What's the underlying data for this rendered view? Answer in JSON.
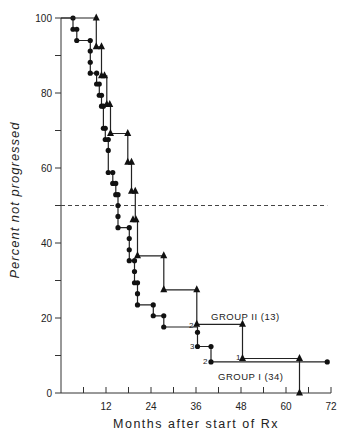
{
  "chart_data": {
    "type": "line",
    "subtype": "kaplan-meier step curve",
    "title": "",
    "xlabel": "Months after start of Rx",
    "ylabel": "Percent not progressed",
    "xlim": [
      0,
      72
    ],
    "ylim": [
      0,
      100
    ],
    "x_ticks": [
      0,
      6,
      12,
      18,
      24,
      30,
      36,
      42,
      48,
      54,
      60,
      66,
      72
    ],
    "x_tick_labels": [
      {
        "value": 12,
        "label": "12"
      },
      {
        "value": 24,
        "label": "24"
      },
      {
        "value": 36,
        "label": "36"
      },
      {
        "value": 48,
        "label": "48"
      },
      {
        "value": 60,
        "label": "60"
      },
      {
        "value": 72,
        "label": "72"
      }
    ],
    "y_ticks": [
      0,
      10,
      20,
      30,
      40,
      50,
      60,
      70,
      80,
      90,
      100
    ],
    "y_tick_labels": [
      {
        "value": 0,
        "label": "0"
      },
      {
        "value": 20,
        "label": "20"
      },
      {
        "value": 40,
        "label": "40"
      },
      {
        "value": 60,
        "label": "60"
      },
      {
        "value": 80,
        "label": "80"
      },
      {
        "value": 100,
        "label": "100"
      }
    ],
    "grid": false,
    "reference_line": {
      "y": 50,
      "style": "dashed",
      "x_start": 0,
      "x_end": 71
    },
    "series": [
      {
        "name": "GROUP I (34)",
        "marker": "circle",
        "steps": [
          [
            0,
            100
          ],
          [
            3.2,
            100
          ],
          [
            3.2,
            97
          ],
          [
            4.2,
            97
          ],
          [
            4.2,
            94
          ],
          [
            7.8,
            94
          ],
          [
            7.8,
            91.2
          ],
          [
            7.8,
            88.2
          ],
          [
            7.8,
            85.3
          ],
          [
            9.5,
            85.3
          ],
          [
            9.5,
            82.4
          ],
          [
            10.2,
            82.4
          ],
          [
            10.2,
            79.4
          ],
          [
            10.8,
            79.4
          ],
          [
            10.8,
            76.5
          ],
          [
            11.3,
            76.5
          ],
          [
            11.3,
            70.6
          ],
          [
            11.8,
            70.6
          ],
          [
            11.8,
            67.6
          ],
          [
            12.6,
            67.6
          ],
          [
            12.6,
            64.7
          ],
          [
            12.6,
            58.8
          ],
          [
            13.8,
            58.8
          ],
          [
            13.8,
            55.9
          ],
          [
            14.6,
            55.9
          ],
          [
            14.6,
            52.9
          ],
          [
            15.2,
            52.9
          ],
          [
            15.2,
            50
          ],
          [
            15.2,
            47.1
          ],
          [
            15.2,
            44.1
          ],
          [
            18.2,
            44.1
          ],
          [
            18.2,
            41.2
          ],
          [
            18.2,
            38.2
          ],
          [
            18.2,
            35.3
          ],
          [
            19.6,
            35.3
          ],
          [
            19.6,
            32.4
          ],
          [
            19.6,
            29.4
          ],
          [
            20.4,
            29.4
          ],
          [
            20.4,
            26.5
          ],
          [
            20.4,
            23.5
          ],
          [
            24.6,
            23.5
          ],
          [
            24.6,
            20.6
          ],
          [
            27.4,
            20.6
          ],
          [
            27.4,
            17.6
          ],
          [
            36.4,
            17.6
          ],
          [
            36.4,
            16.2
          ],
          [
            36.4,
            12.4
          ],
          [
            40,
            12.4
          ],
          [
            40,
            8.3
          ],
          [
            71,
            8.3
          ]
        ],
        "markers": [
          [
            3.2,
            100
          ],
          [
            3.2,
            97
          ],
          [
            4.2,
            97
          ],
          [
            4.2,
            94
          ],
          [
            7.8,
            94
          ],
          [
            7.8,
            91.2
          ],
          [
            7.8,
            88.2
          ],
          [
            7.8,
            85.3
          ],
          [
            9.5,
            85.3
          ],
          [
            9.5,
            82.4
          ],
          [
            10.2,
            82.4
          ],
          [
            10.2,
            79.4
          ],
          [
            10.8,
            79.4
          ],
          [
            10.8,
            76.5
          ],
          [
            11.3,
            76.5
          ],
          [
            11.3,
            70.6
          ],
          [
            11.8,
            70.6
          ],
          [
            11.8,
            67.6
          ],
          [
            12.6,
            67.6
          ],
          [
            12.6,
            64.7
          ],
          [
            12.6,
            58.8
          ],
          [
            13.8,
            58.8
          ],
          [
            13.8,
            55.9
          ],
          [
            14.6,
            55.9
          ],
          [
            14.6,
            52.9
          ],
          [
            15.2,
            52.9
          ],
          [
            15.2,
            50
          ],
          [
            15.2,
            47.1
          ],
          [
            15.2,
            44.1
          ],
          [
            18.2,
            44.1
          ],
          [
            18.2,
            41.2
          ],
          [
            18.2,
            38.2
          ],
          [
            18.2,
            35.3
          ],
          [
            19.6,
            35.3
          ],
          [
            19.6,
            32.4
          ],
          [
            19.6,
            29.4
          ],
          [
            20.4,
            29.4
          ],
          [
            20.4,
            26.5
          ],
          [
            20.4,
            23.5
          ],
          [
            24.6,
            23.5
          ],
          [
            24.6,
            20.6
          ],
          [
            27.4,
            20.6
          ],
          [
            27.4,
            17.6
          ],
          [
            36.4,
            16.2
          ],
          [
            36.4,
            12.4
          ],
          [
            40,
            12.4
          ],
          [
            40,
            8.3
          ],
          [
            71,
            8.3
          ]
        ]
      },
      {
        "name": "GROUP II (13)",
        "marker": "triangle",
        "steps": [
          [
            0,
            100
          ],
          [
            9.4,
            100
          ],
          [
            9.4,
            92.3
          ],
          [
            10.8,
            92.3
          ],
          [
            10.8,
            84.6
          ],
          [
            12.2,
            84.6
          ],
          [
            12.2,
            76.9
          ],
          [
            13.2,
            76.9
          ],
          [
            13.2,
            69.2
          ],
          [
            17.8,
            69.2
          ],
          [
            17.8,
            61.5
          ],
          [
            18.8,
            61.5
          ],
          [
            18.8,
            53.8
          ],
          [
            19.8,
            53.8
          ],
          [
            19.8,
            46.2
          ],
          [
            20.4,
            46.2
          ],
          [
            20.4,
            36.6
          ],
          [
            27.4,
            36.6
          ],
          [
            27.4,
            27.5
          ],
          [
            36.2,
            27.5
          ],
          [
            36.2,
            18.3
          ],
          [
            48.4,
            18.3
          ],
          [
            48.4,
            9.2
          ],
          [
            63.6,
            9.2
          ],
          [
            63.6,
            0
          ]
        ],
        "markers": [
          [
            9.4,
            100
          ],
          [
            9.4,
            92.3
          ],
          [
            10.8,
            92.3
          ],
          [
            10.8,
            84.6
          ],
          [
            11.6,
            84.6
          ],
          [
            12.2,
            76.9
          ],
          [
            13.0,
            76.9
          ],
          [
            13.2,
            69.2
          ],
          [
            17.8,
            69.2
          ],
          [
            17.8,
            61.5
          ],
          [
            18.8,
            61.5
          ],
          [
            18.8,
            53.8
          ],
          [
            19.8,
            53.8
          ],
          [
            19.2,
            46.2
          ],
          [
            20.0,
            46.2
          ],
          [
            20.4,
            36.6
          ],
          [
            27.4,
            36.6
          ],
          [
            27.4,
            27.5
          ],
          [
            36.2,
            27.5
          ],
          [
            36.2,
            18.3
          ],
          [
            48.4,
            18.3
          ],
          [
            48.4,
            9.2
          ],
          [
            63.6,
            9.2
          ],
          [
            63.6,
            0
          ]
        ]
      }
    ],
    "annotations": [
      {
        "text": "GROUP II (13)",
        "x": 40,
        "y": 21
      },
      {
        "text": "GROUP I (34)",
        "x": 42.5,
        "y": 4.5
      },
      {
        "text": "2",
        "x": 34.6,
        "y": 18.3
      },
      {
        "text": "3",
        "x": 35,
        "y": 12.4
      },
      {
        "text": "2",
        "x": 38.6,
        "y": 8.3
      },
      {
        "text": "1",
        "x": 46.8,
        "y": 9.9
      }
    ]
  },
  "labels": {
    "xlabel": "Months after start of Rx",
    "ylabel": "Percent not progressed",
    "group1": "GROUP I (34)",
    "group2": "GROUP II (13)",
    "n2": "2",
    "n3": "3",
    "n2b": "2",
    "n1": "1"
  }
}
